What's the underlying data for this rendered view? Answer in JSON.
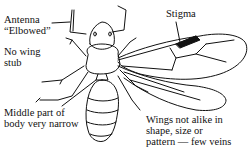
{
  "diagram": {
    "labels": {
      "antenna_line1": "Antenna",
      "antenna_line2": "“Elbowed”",
      "stigma": "Stigma",
      "no_wing_line1": "No wing",
      "no_wing_line2": "stub",
      "middle_line1": "Middle part of",
      "middle_line2": "body very narrow",
      "wings_line1": "Wings not alike in",
      "wings_line2": "shape, size or",
      "wings_line3": "pattern — few veins"
    },
    "colors": {
      "ink": "#111111",
      "background": "#ffffff"
    }
  }
}
